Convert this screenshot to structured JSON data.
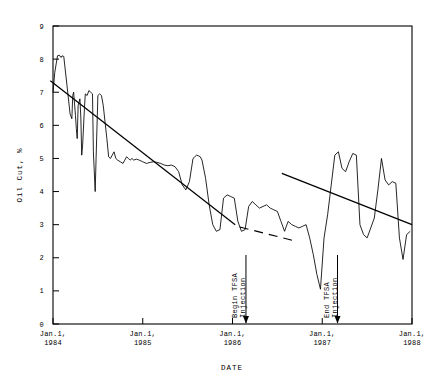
{
  "chart_data": {
    "type": "line",
    "title": "",
    "xlabel": "DATE",
    "ylabel": "Oil Cut, %",
    "ylim": [
      0,
      9
    ],
    "xlim": [
      "Jan.1, 1984",
      "Jan.1, 1988"
    ],
    "grid": false,
    "legend": null,
    "y_ticks": [
      "0",
      "1",
      "2",
      "3",
      "4",
      "5",
      "6",
      "7",
      "8",
      "9"
    ],
    "x_ticks": [
      {
        "line1": "Jan.1,",
        "line2": "1984"
      },
      {
        "line1": "Jan.1,",
        "line2": "1985"
      },
      {
        "line1": "Jan.1,",
        "line2": "1986"
      },
      {
        "line1": "Jan.1,",
        "line2": "1987"
      },
      {
        "line1": "Jan.1,",
        "line2": "1988"
      }
    ],
    "annotations": [
      {
        "name": "begin-tfsa-injection",
        "line1": "Begin TFSA",
        "line2": "Injection",
        "x_date": 1986.15,
        "arrow": true
      },
      {
        "name": "end-tfsa-injection",
        "line1": "End TFSA",
        "line2": "Injection",
        "x_date": 1987.17,
        "arrow": true
      }
    ],
    "series": [
      {
        "name": "Oil Cut",
        "style": "solid-noisy",
        "x": [
          1984.0,
          1984.02,
          1984.05,
          1984.07,
          1984.09,
          1984.1,
          1984.12,
          1984.16,
          1984.19,
          1984.21,
          1984.22,
          1984.23,
          1984.25,
          1984.26,
          1984.27,
          1984.28,
          1984.3,
          1984.31,
          1984.32,
          1984.33,
          1984.35,
          1984.36,
          1984.38,
          1984.4,
          1984.42,
          1984.44,
          1984.45,
          1984.47,
          1984.48,
          1984.5,
          1984.52,
          1984.54,
          1984.56,
          1984.58,
          1984.6,
          1984.62,
          1984.64,
          1984.66,
          1984.68,
          1984.7,
          1984.72,
          1984.75,
          1984.78,
          1984.8,
          1984.82,
          1984.84,
          1984.86,
          1984.88,
          1984.9,
          1984.93,
          1984.96,
          1985.0,
          1985.04,
          1985.08,
          1985.12,
          1985.16,
          1985.2,
          1985.24,
          1985.28,
          1985.32,
          1985.36,
          1985.4,
          1985.44,
          1985.48,
          1985.52,
          1985.56,
          1985.58,
          1985.6,
          1985.62,
          1985.64,
          1985.66,
          1985.7,
          1985.74,
          1985.78,
          1985.82,
          1985.86,
          1985.9,
          1985.94,
          1985.98,
          1986.02,
          1986.06,
          1986.1,
          1986.14,
          1986.18,
          1986.22,
          1986.26,
          1986.3,
          1986.34,
          1986.38,
          1986.42,
          1986.46,
          1986.5,
          1986.54,
          1986.58,
          1986.62,
          1986.66,
          1986.7,
          1986.74,
          1986.78,
          1986.82,
          1986.86,
          1986.9,
          1986.94,
          1986.98,
          1987.02,
          1987.06,
          1987.1,
          1987.14,
          1987.18,
          1987.22,
          1987.26,
          1987.3,
          1987.34,
          1987.38,
          1987.42,
          1987.46,
          1987.5,
          1987.54,
          1987.58,
          1987.62,
          1987.66,
          1987.7,
          1987.74,
          1987.78,
          1987.82,
          1987.86,
          1987.9,
          1987.94,
          1987.98
        ],
        "y": [
          7.0,
          7.6,
          8.1,
          8.12,
          8.05,
          8.1,
          8.08,
          7.1,
          6.35,
          6.2,
          6.9,
          7.0,
          6.3,
          5.9,
          5.6,
          6.6,
          6.8,
          6.25,
          5.1,
          5.4,
          6.5,
          6.95,
          6.9,
          7.05,
          7.0,
          6.95,
          5.2,
          4.0,
          5.0,
          6.9,
          6.95,
          6.9,
          6.6,
          6.1,
          5.6,
          5.05,
          5.0,
          5.1,
          5.2,
          5.0,
          4.95,
          4.9,
          4.85,
          4.95,
          5.05,
          5.0,
          4.95,
          5.0,
          4.95,
          4.98,
          4.95,
          4.9,
          4.85,
          4.88,
          4.9,
          4.88,
          4.85,
          4.8,
          4.78,
          4.8,
          4.75,
          4.6,
          4.2,
          4.05,
          4.3,
          5.0,
          5.05,
          5.1,
          5.08,
          5.05,
          4.95,
          4.4,
          3.6,
          3.0,
          2.8,
          2.85,
          3.8,
          3.9,
          3.85,
          3.8,
          3.1,
          2.8,
          2.85,
          3.55,
          3.7,
          3.6,
          3.5,
          3.55,
          3.6,
          3.5,
          3.45,
          3.4,
          3.1,
          2.8,
          3.1,
          3.0,
          2.95,
          2.9,
          2.95,
          3.0,
          2.6,
          2.1,
          1.5,
          1.05,
          2.6,
          3.3,
          4.2,
          5.1,
          5.2,
          4.7,
          4.6,
          4.9,
          5.15,
          5.1,
          3.0,
          2.7,
          2.6,
          2.9,
          3.2,
          4.05,
          5.0,
          4.35,
          4.2,
          4.3,
          4.25,
          2.6,
          1.95,
          2.7,
          2.8
        ]
      }
    ],
    "trend_lines": [
      {
        "name": "pre-injection-trend",
        "style": "solid",
        "x0": 1983.97,
        "y0": 7.35,
        "x1": 1986.03,
        "y1": 3.0
      },
      {
        "name": "pre-injection-trend-extension",
        "style": "dashed",
        "x0": 1986.08,
        "y0": 2.93,
        "x1": 1986.68,
        "y1": 2.52
      },
      {
        "name": "post-injection-trend",
        "style": "solid",
        "x0": 1986.55,
        "y0": 4.55,
        "x1": 1988.0,
        "y1": 3.0
      }
    ]
  }
}
